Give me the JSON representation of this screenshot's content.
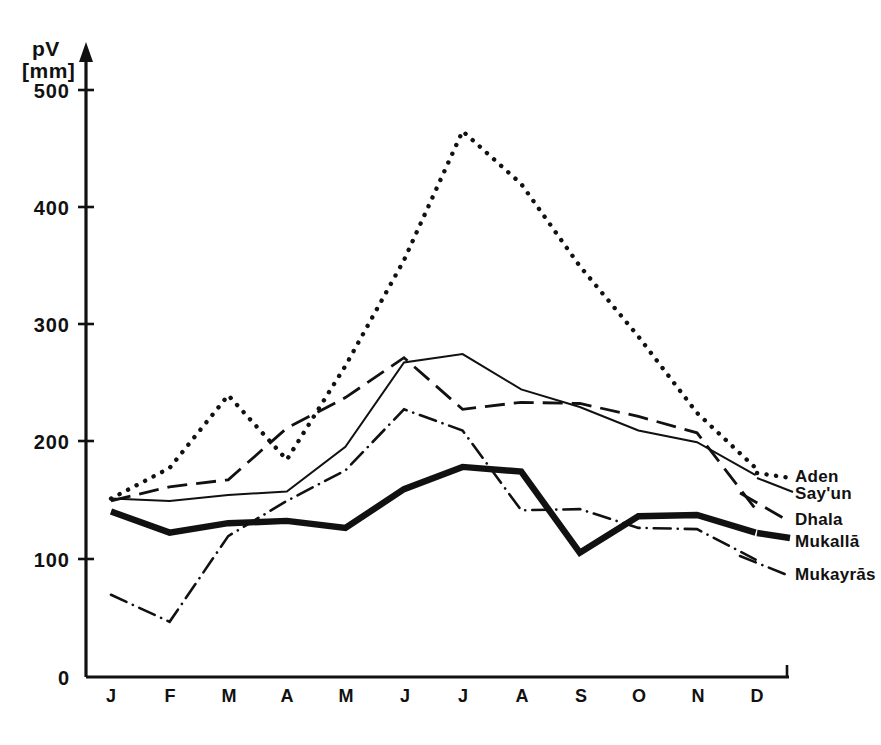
{
  "chart_data": {
    "type": "line",
    "title": "",
    "ylabel": "pV",
    "yunit": "[mm]",
    "xlabel": "",
    "categories": [
      "J",
      "F",
      "M",
      "A",
      "M",
      "J",
      "J",
      "A",
      "S",
      "O",
      "N",
      "D"
    ],
    "ytick_labels": [
      "0",
      "100",
      "200",
      "300",
      "400",
      "500"
    ],
    "ytick_values": [
      0,
      100,
      200,
      300,
      400,
      500
    ],
    "ylim": [
      0,
      530
    ],
    "grid": "none",
    "legend_position": "right-inline",
    "series": [
      {
        "name": "Aden",
        "style": "dotted",
        "values": [
          152,
          178,
          240,
          185,
          265,
          355,
          465,
          420,
          350,
          290,
          225,
          178
        ]
      },
      {
        "name": "Say'un",
        "style": "solid-thin",
        "values": [
          152,
          150,
          155,
          158,
          196,
          268,
          275,
          245,
          230,
          210,
          200,
          172
        ]
      },
      {
        "name": "Dhala",
        "style": "dashed",
        "values": [
          150,
          162,
          168,
          212,
          238,
          272,
          228,
          234,
          233,
          222,
          208,
          143
        ]
      },
      {
        "name": "Mukallā",
        "style": "solid-thick",
        "values": [
          141,
          123,
          131,
          133,
          127,
          160,
          179,
          175,
          106,
          137,
          138,
          123
        ]
      },
      {
        "name": "Mukayrās",
        "style": "dash-dot",
        "values": [
          70,
          47,
          120,
          150,
          176,
          228,
          210,
          142,
          143,
          127,
          126,
          100
        ]
      }
    ]
  },
  "axis": {
    "y_label_top": "pV",
    "y_label_unit": "[mm]",
    "zero_label": "0"
  }
}
